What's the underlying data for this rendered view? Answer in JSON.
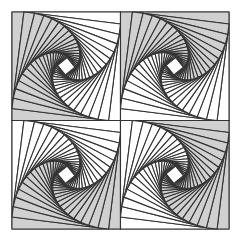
{
  "figure": {
    "title": "",
    "width": 237,
    "height": 239,
    "origin": [
      12,
      12
    ],
    "quadrant_size": 108.5,
    "iterations": 20,
    "t": 0.11,
    "colors": {
      "background": "#ffffff",
      "fill_gray": "#d0d0d0",
      "fill_white": "#ffffff",
      "stroke": "#333333"
    },
    "stroke_width": 1.1,
    "quadrants": [
      {
        "name": "top-left",
        "col": 0,
        "row": 0,
        "gray_regions": [
          "left",
          "bottom"
        ]
      },
      {
        "name": "top-right",
        "col": 1,
        "row": 0,
        "gray_regions": [
          "top",
          "left"
        ]
      },
      {
        "name": "bottom-left",
        "col": 0,
        "row": 1,
        "gray_regions": [
          "right",
          "bottom"
        ]
      },
      {
        "name": "bottom-right",
        "col": 1,
        "row": 1,
        "gray_regions": [
          "top",
          "right"
        ]
      }
    ]
  }
}
